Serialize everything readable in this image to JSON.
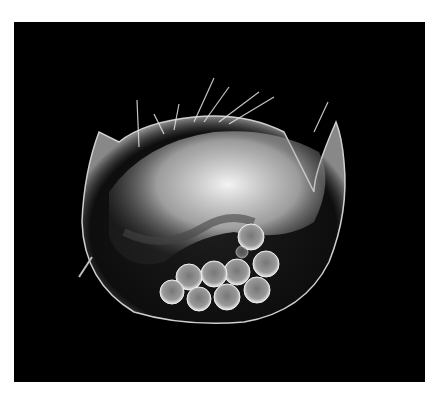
{
  "image": {
    "subject": "water flea (cladoceran) with brood of eggs, darkfield microscopy",
    "background_color": "#000000",
    "border_color": "#ffffff",
    "egg_count": 11
  }
}
